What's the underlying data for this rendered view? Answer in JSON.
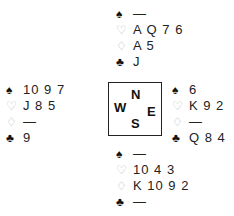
{
  "suits": {
    "spades": "♠",
    "hearts": "♡",
    "diamonds": "♢",
    "clubs": "♣"
  },
  "hands": {
    "north": {
      "spades": "—",
      "hearts": "A Q 7 6",
      "diamonds": "A 5",
      "clubs": "J"
    },
    "west": {
      "spades": "10 9 7",
      "hearts": "J 8 5",
      "diamonds": "—",
      "clubs": "9"
    },
    "east": {
      "spades": "6",
      "hearts": "K 9 2",
      "diamonds": "—",
      "clubs": "Q 8 4"
    },
    "south": {
      "spades": "—",
      "hearts": "10 4 3",
      "diamonds": "K 10 9 2",
      "clubs": "—"
    }
  },
  "compass": {
    "n": "N",
    "w": "W",
    "e": "E",
    "s": "S"
  }
}
